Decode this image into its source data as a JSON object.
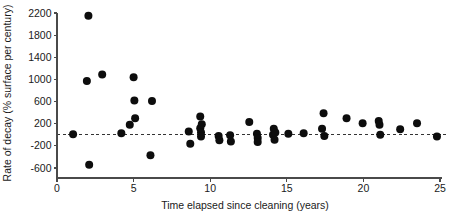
{
  "chart_data": {
    "type": "scatter",
    "title": "",
    "xlabel": "Time elapsed since cleaning (years)",
    "ylabel": "Rate of decay (% surface per century)",
    "xlim": [
      0,
      25
    ],
    "ylim": [
      -700,
      2300
    ],
    "xticks": [
      0,
      5,
      10,
      15,
      20,
      25
    ],
    "yticks": [
      -600,
      -200,
      200,
      600,
      1000,
      1400,
      1800,
      2200
    ],
    "xtick_labels": [
      "0",
      "5",
      "10",
      "15",
      "20",
      "25"
    ],
    "ytick_labels": [
      "-600",
      "-200",
      "200",
      "600",
      "1000",
      "1400",
      "1800",
      "2200"
    ],
    "grid": false,
    "legend": null,
    "reference_line": {
      "orientation": "horizontal",
      "y": 0,
      "style": "dashed"
    },
    "marker": {
      "shape": "circle",
      "color": "#0d0d0d",
      "size": 4.0
    },
    "points": [
      {
        "x": 1.05,
        "y": 10
      },
      {
        "x": 1.95,
        "y": 970
      },
      {
        "x": 2.05,
        "y": 2150
      },
      {
        "x": 2.1,
        "y": -540
      },
      {
        "x": 2.95,
        "y": 1090
      },
      {
        "x": 4.2,
        "y": 30
      },
      {
        "x": 5.0,
        "y": 1040
      },
      {
        "x": 5.05,
        "y": 620
      },
      {
        "x": 5.1,
        "y": 300
      },
      {
        "x": 4.75,
        "y": 180
      },
      {
        "x": 6.2,
        "y": 610
      },
      {
        "x": 6.1,
        "y": -370
      },
      {
        "x": 8.6,
        "y": 60
      },
      {
        "x": 8.7,
        "y": -160
      },
      {
        "x": 9.35,
        "y": 330
      },
      {
        "x": 9.35,
        "y": 120
      },
      {
        "x": 9.4,
        "y": 40
      },
      {
        "x": 9.4,
        "y": -30
      },
      {
        "x": 9.45,
        "y": 190
      },
      {
        "x": 10.55,
        "y": -20
      },
      {
        "x": 10.6,
        "y": -100
      },
      {
        "x": 11.3,
        "y": -10
      },
      {
        "x": 11.35,
        "y": -120
      },
      {
        "x": 12.55,
        "y": 230
      },
      {
        "x": 13.05,
        "y": 20
      },
      {
        "x": 13.1,
        "y": -60
      },
      {
        "x": 13.1,
        "y": -130
      },
      {
        "x": 14.1,
        "y": 0
      },
      {
        "x": 14.15,
        "y": 110
      },
      {
        "x": 14.2,
        "y": -90
      },
      {
        "x": 14.25,
        "y": 40
      },
      {
        "x": 15.1,
        "y": 20
      },
      {
        "x": 16.1,
        "y": 30
      },
      {
        "x": 17.3,
        "y": 110
      },
      {
        "x": 17.4,
        "y": 390
      },
      {
        "x": 17.45,
        "y": -20
      },
      {
        "x": 18.9,
        "y": 300
      },
      {
        "x": 19.95,
        "y": 210
      },
      {
        "x": 21.0,
        "y": 250
      },
      {
        "x": 21.05,
        "y": 180
      },
      {
        "x": 21.1,
        "y": 0
      },
      {
        "x": 22.4,
        "y": 100
      },
      {
        "x": 23.5,
        "y": 210
      },
      {
        "x": 24.8,
        "y": -30
      }
    ]
  }
}
